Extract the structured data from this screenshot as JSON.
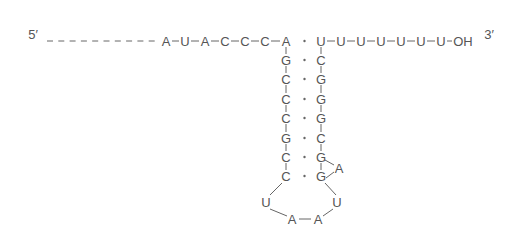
{
  "diagram": {
    "type": "RNA hairpin secondary structure",
    "labels": {
      "five_prime": "5′",
      "three_prime": "3′"
    },
    "colors": {
      "text": "#555555",
      "line": "#666666"
    },
    "five_prime_dashes": 10,
    "leader": [
      "A",
      "U",
      "A",
      "C",
      "C",
      "C"
    ],
    "stem_left": [
      "A",
      "G",
      "C",
      "C",
      "C",
      "G",
      "C",
      "C"
    ],
    "stem_right": [
      "U",
      "C",
      "G",
      "G",
      "G",
      "C",
      "G",
      "G"
    ],
    "bulge": "A",
    "loop": [
      "U",
      "A",
      "A",
      "U"
    ],
    "trailer": [
      "U",
      "U",
      "U",
      "U",
      "U",
      "U",
      "OH"
    ]
  }
}
